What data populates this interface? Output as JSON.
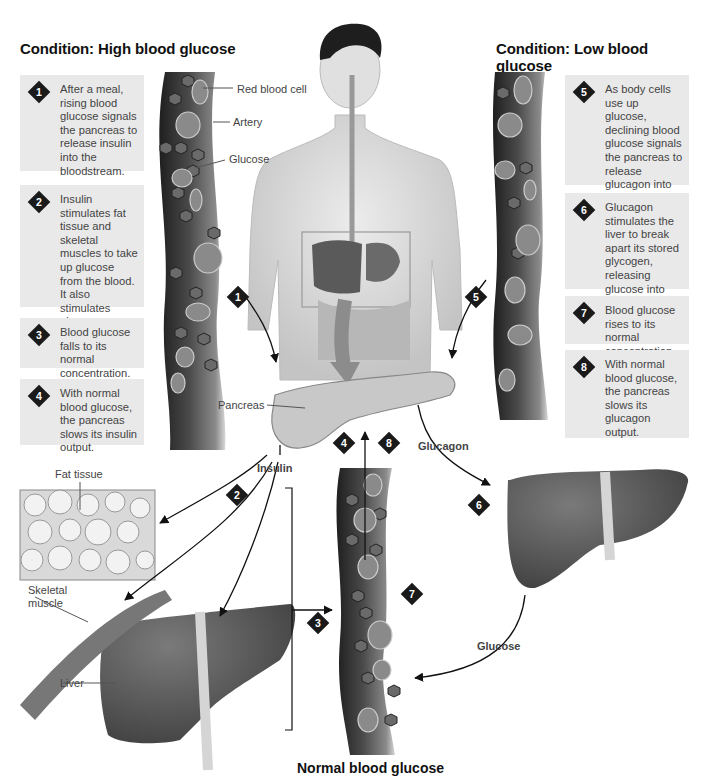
{
  "titles": {
    "high": "Condition: High blood glucose",
    "low": "Condition: Low blood glucose",
    "normal": "Normal blood glucose"
  },
  "steps": [
    {
      "num": "1",
      "text": "After a meal, rising blood glucose signals the pancreas to release insulin into the bloodstream."
    },
    {
      "num": "2",
      "text": "Insulin stimulates fat tissue and skeletal muscles to take up glucose from the blood. It also stimulates glycogen storage by the liver."
    },
    {
      "num": "3",
      "text": "Blood glucose falls to its normal concentration."
    },
    {
      "num": "4",
      "text": "With normal blood glucose, the pancreas slows its insulin output."
    },
    {
      "num": "5",
      "text": "As body cells use up glucose, declining blood glucose signals the pancreas to release glucagon into the bloodstream."
    },
    {
      "num": "6",
      "text": "Glucagon stimulates the liver to break apart its stored glycogen, releasing glucose into the bloodstream."
    },
    {
      "num": "7",
      "text": "Blood glucose rises to its normal concentration."
    },
    {
      "num": "8",
      "text": "With normal blood glucose, the pancreas slows its glucagon output."
    }
  ],
  "labels": {
    "red_blood_cell": "Red blood cell",
    "artery": "Artery",
    "glucose": "Glucose",
    "pancreas": "Pancreas",
    "insulin": "Insulin",
    "glucagon": "Glucagon",
    "glucose_flow": "Glucose",
    "fat_tissue": "Fat tissue",
    "skeletal_muscle": "Skeletal muscle",
    "liver": "Liver"
  },
  "colors": {
    "box_bg": "#e9e9e9",
    "marker": "#1a1a1a",
    "organ": "#555555",
    "vessel": "#3a3a3a"
  }
}
